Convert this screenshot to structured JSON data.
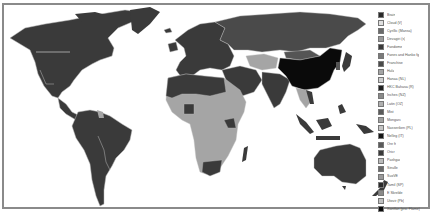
{
  "map": {
    "type": "choropleth-world-map",
    "colors": {
      "darkest": "#0a0a0a",
      "dark": "#3a3a3a",
      "medium_dark": "#555555",
      "medium": "#9a9a9a",
      "light": "#b5b5b5",
      "background": "#ffffff",
      "frame": "#8a8a8a"
    },
    "regions": {
      "north_america": "#3a3a3a",
      "south_america": "#3a3a3a",
      "french_guiana": "#a5a5a5",
      "greenland": "#3a3a3a",
      "europe": "#3a3a3a",
      "russia": "#4a4a4a",
      "north_africa": "#3a3a3a",
      "sub_saharan_africa": "#a5a5a5",
      "south_africa": "#3a3a3a",
      "madagascar": "#3a3a3a",
      "middle_east": "#3a3a3a",
      "central_asia": "#a5a5a5",
      "india": "#3a3a3a",
      "china": "#0a0a0a",
      "southeast_asia": "#a5a5a5",
      "indonesia": "#3a3a3a",
      "australia": "#3a3a3a",
      "new_zealand": "#3a3a3a",
      "japan": "#3a3a3a"
    }
  },
  "legend": {
    "items": [
      {
        "label": "Brain",
        "color": "#2a2a2a"
      },
      {
        "label": "Cloud (V)",
        "color": "#e0e0e0"
      },
      {
        "label": "Cyrillic (Mansa)",
        "color": "#6a6a6a"
      },
      {
        "label": "Devagiri (s)",
        "color": "#9a9a9a"
      },
      {
        "label": "Fandome",
        "color": "#3a3a3a"
      },
      {
        "label": "Fanes and Hanko fg",
        "color": "#7a7a7a"
      },
      {
        "label": "Franchise",
        "color": "#4a4a4a"
      },
      {
        "label": "Hula",
        "color": "#a5a5a5"
      },
      {
        "label": "Hanaa (NL)",
        "color": "#d0d0d0"
      },
      {
        "label": "HKC Bahasa (R)",
        "color": "#202020"
      },
      {
        "label": "Inches (NZ)",
        "color": "#8a8a8a"
      },
      {
        "label": "Latin (OZ)",
        "color": "#b0b0b0"
      },
      {
        "label": "Mist",
        "color": "#5a5a5a"
      },
      {
        "label": "Mongarc",
        "color": "#a0a0a0"
      },
      {
        "label": "Nasseriken (PL)",
        "color": "#c5c5c5"
      },
      {
        "label": "Nelleg (IT)",
        "color": "#151515"
      },
      {
        "label": "Ore fr",
        "color": "#5a5a5a"
      },
      {
        "label": "Oricr",
        "color": "#3a3a3a"
      },
      {
        "label": "Pashgar",
        "color": "#bcbcbc"
      },
      {
        "label": "Sinulle",
        "color": "#6a6a6a"
      },
      {
        "label": "SuxVE",
        "color": "#9a9a9a"
      },
      {
        "label": "Tamil (SP)",
        "color": "#2a2a2a"
      },
      {
        "label": "E Skrelde",
        "color": "#8a8a8a"
      },
      {
        "label": "Utovir (Pb)",
        "color": "#c0c0c0"
      },
      {
        "label": "Xantfan (pro. Flame)",
        "color": "#0a0a0a"
      }
    ]
  }
}
